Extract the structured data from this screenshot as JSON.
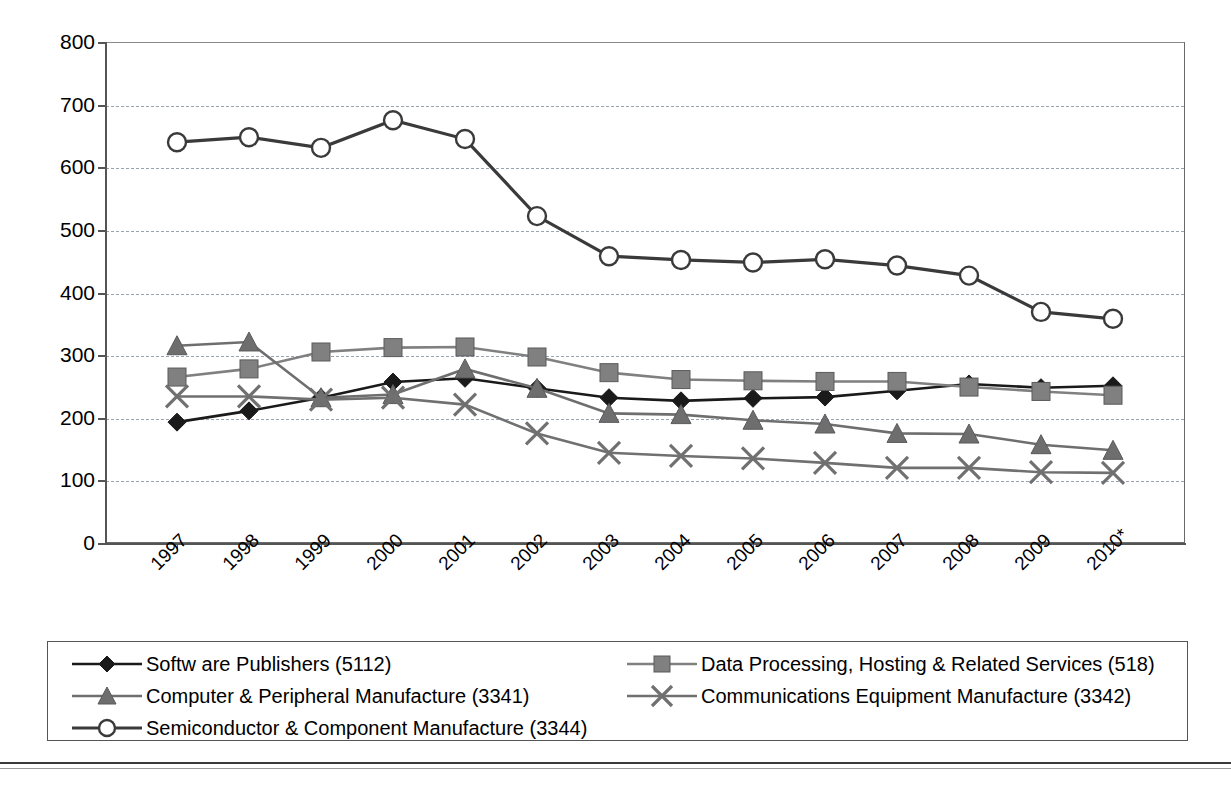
{
  "chart_data": {
    "type": "line",
    "title": "",
    "subtitle": "",
    "xlabel": "",
    "ylabel": "",
    "ylim": [
      0,
      800
    ],
    "ytick_step": 100,
    "yticks": [
      "0",
      "100",
      "200",
      "300",
      "400",
      "500",
      "600",
      "700",
      "800"
    ],
    "grid": true,
    "legend_position": "bottom",
    "x_label_rotation": -45,
    "categories": [
      "1997",
      "1998",
      "1999",
      "2000",
      "2001",
      "2002",
      "2003",
      "2004",
      "2005",
      "2006",
      "2007",
      "2008",
      "2009",
      "2010*"
    ],
    "series": [
      {
        "name": "Softw are Publishers (5112)",
        "marker": "diamond",
        "color": "#1a1a1a",
        "values": [
          193,
          211,
          232,
          257,
          263,
          247,
          232,
          227,
          231,
          233,
          243,
          254,
          248,
          251
        ]
      },
      {
        "name": "Data Processing, Hosting & Related Services (518)",
        "marker": "square",
        "color": "#808080",
        "values": [
          265,
          278,
          305,
          312,
          313,
          297,
          272,
          261,
          259,
          258,
          258,
          249,
          242,
          236
        ]
      },
      {
        "name": "Computer & Peripheral Manufacture (3341)",
        "marker": "triangle",
        "color": "#6e6e6e",
        "values": [
          315,
          321,
          232,
          237,
          278,
          247,
          207,
          205,
          196,
          190,
          175,
          174,
          157,
          148
        ]
      },
      {
        "name": "Communications Equipment Manufacture (3342)",
        "marker": "cross",
        "color": "#707070",
        "values": [
          234,
          234,
          229,
          232,
          221,
          175,
          144,
          139,
          135,
          128,
          120,
          120,
          113,
          112
        ]
      },
      {
        "name": "Semiconductor & Component Manufacture (3344)",
        "marker": "circle",
        "color": "#3a3a3a",
        "values": [
          640,
          648,
          631,
          675,
          645,
          522,
          458,
          452,
          448,
          453,
          443,
          427,
          369,
          358
        ]
      }
    ]
  },
  "legend": {
    "columns": [
      {
        "items": [
          {
            "label": "Softw are Publishers (5112)",
            "series_index": 0
          },
          {
            "label": "Computer & Peripheral Manufacture (3341)",
            "series_index": 2
          },
          {
            "label": "Semiconductor & Component Manufacture (3344)",
            "series_index": 4
          }
        ]
      },
      {
        "items": [
          {
            "label": "Data Processing, Hosting & Related Services (518)",
            "series_index": 1
          },
          {
            "label": "Communications Equipment Manufacture (3342)",
            "series_index": 3
          }
        ]
      }
    ]
  }
}
